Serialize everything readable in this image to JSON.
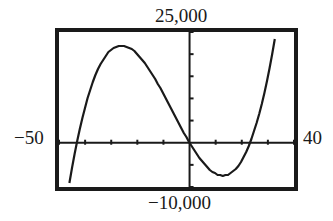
{
  "chart_data": {
    "type": "line",
    "title": "",
    "xlabel": "",
    "ylabel": "",
    "xlim": [
      -50,
      40
    ],
    "ylim": [
      -10000,
      25000
    ],
    "xtick_step": 10,
    "ytick_step": 5000,
    "grid": false,
    "window_labels": {
      "xmin": "−50",
      "xmax": "40",
      "ymin": "−10,000",
      "ymax": "25,000"
    },
    "series": [
      {
        "name": "y = x^3 + 20x^2 - 1000x",
        "function": "x^3 + 20*x^2 - 1000*x",
        "x": [
          -46,
          -44,
          -42,
          -40,
          -35,
          -30,
          -26,
          -20,
          -15,
          -10,
          -5,
          0,
          5,
          10,
          13,
          15,
          20,
          23,
          25,
          28,
          30,
          33
        ],
        "values": [
          -9016,
          -2464,
          3192,
          8000,
          16125,
          20400,
          21944,
          20000,
          16125,
          11000,
          5375,
          0,
          -4375,
          -7000,
          -7437,
          -7125,
          -4000,
          -303,
          3125,
          9632,
          15000,
          24717
        ]
      }
    ],
    "key_points": {
      "local_max": {
        "x": -26.1,
        "y": 21945
      },
      "local_min": {
        "x": 12.8,
        "y": -7427
      },
      "roots": [
        -43.2,
        0,
        23.2
      ]
    },
    "colors": {
      "line": "#1a1a1a",
      "frame": "#1a1a1a",
      "background": "#ffffff"
    }
  }
}
